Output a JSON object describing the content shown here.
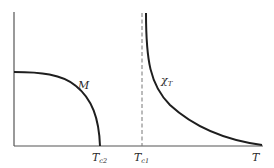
{
  "diagram": {
    "type": "phase-transition-sketch",
    "axes": {
      "x_label": "T",
      "y_label": ""
    },
    "curves": [
      {
        "name": "magnetization",
        "label": "M",
        "shape": "decreasing to zero at Tc2"
      },
      {
        "name": "susceptibility",
        "label_main": "χ",
        "label_sub": "T",
        "shape": "diverges at Tc1, decays for T > Tc1"
      }
    ],
    "markers": [
      {
        "name": "Tc2",
        "label_main": "T",
        "label_sub": "c2",
        "style": "curve-endpoint"
      },
      {
        "name": "Tc1",
        "label_main": "T",
        "label_sub": "c1",
        "style": "dashed-vertical"
      }
    ],
    "colors": {
      "curve": "#1e1e1e",
      "axis": "#555555",
      "dashed": "#777777",
      "background": "#ffffff"
    }
  }
}
